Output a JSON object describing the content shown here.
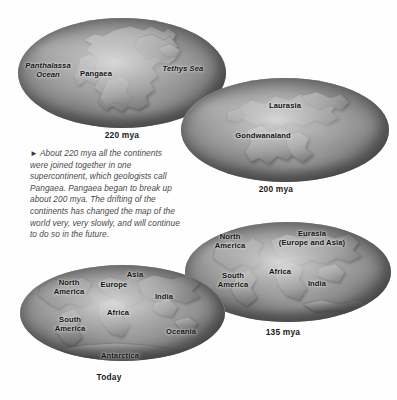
{
  "figure": {
    "background_color": "#ffffff",
    "label_color": "#111111",
    "text_color": "#4a4a4a"
  },
  "caption": {
    "marker": "►",
    "text": "About 220 mya all the continents were joined together in one supercontinent, which geologists call Pangaea. Pangaea began to break up about 200 mya. The drifting of the continents has changed the map of the world very, very slowly, and will continue to do so in the future."
  },
  "globes": [
    {
      "id": "globe-220mya",
      "era_label": "220 mya",
      "labels": [
        {
          "name": "panthalassa-ocean",
          "text": "Panthalassa\nOcean",
          "style": "italic"
        },
        {
          "name": "pangaea",
          "text": "Pangaea",
          "style": "normal"
        },
        {
          "name": "tethys-sea",
          "text": "Tethys Sea",
          "style": "italic"
        }
      ]
    },
    {
      "id": "globe-200mya",
      "era_label": "200 mya",
      "labels": [
        {
          "name": "laurasia",
          "text": "Laurasia",
          "style": "normal"
        },
        {
          "name": "gondwanaland",
          "text": "Gondwanaland",
          "style": "normal"
        }
      ]
    },
    {
      "id": "globe-135mya",
      "era_label": "135 mya",
      "labels": [
        {
          "name": "north-america",
          "text": "North\nAmerica",
          "style": "normal"
        },
        {
          "name": "eurasia",
          "text": "Eurasia\n(Europe and Asia)",
          "style": "normal"
        },
        {
          "name": "south-america",
          "text": "South\nAmerica",
          "style": "normal"
        },
        {
          "name": "africa",
          "text": "Africa",
          "style": "normal"
        },
        {
          "name": "india",
          "text": "India",
          "style": "normal"
        }
      ]
    },
    {
      "id": "globe-today",
      "era_label": "Today",
      "labels": [
        {
          "name": "north-america",
          "text": "North\nAmerica",
          "style": "normal"
        },
        {
          "name": "europe",
          "text": "Europe",
          "style": "normal"
        },
        {
          "name": "asia",
          "text": "Asia",
          "style": "normal"
        },
        {
          "name": "india",
          "text": "India",
          "style": "normal"
        },
        {
          "name": "africa",
          "text": "Africa",
          "style": "normal"
        },
        {
          "name": "south-america",
          "text": "South\nAmerica",
          "style": "normal"
        },
        {
          "name": "oceania",
          "text": "Oceania",
          "style": "normal"
        },
        {
          "name": "antarctica",
          "text": "Antarctica",
          "style": "normal"
        }
      ]
    }
  ]
}
